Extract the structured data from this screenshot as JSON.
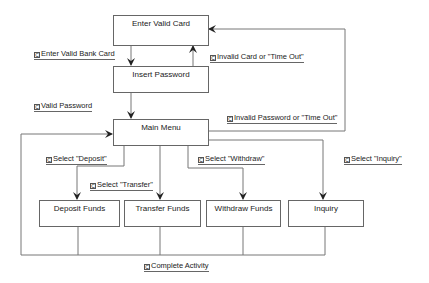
{
  "states": {
    "enter_card": "Enter Valid Card",
    "insert_password": "Insert Password",
    "main_menu": "Main Menu",
    "deposit": "Deposit Funds",
    "transfer": "Transfer Funds",
    "withdraw": "Withdraw Funds",
    "inquiry": "Inquiry"
  },
  "transitions": {
    "enter_bank_card": "Enter Valid Bank Card",
    "invalid_card": "Invalid Card or \"Time Out\"",
    "valid_password": "Valid Password",
    "invalid_password": "Invalid Password or \"Time Out\"",
    "select_deposit": "Select \"Deposit\"",
    "select_transfer": "Select \"Transfer\"",
    "select_withdraw": "Select \"Withdraw\"",
    "select_inquiry": "Select \"Inquiry\"",
    "complete_activity": "Complete Activity"
  },
  "guard_icon": "C",
  "colors": {
    "line": "#666666",
    "text": "#222222",
    "background": "#ffffff"
  }
}
